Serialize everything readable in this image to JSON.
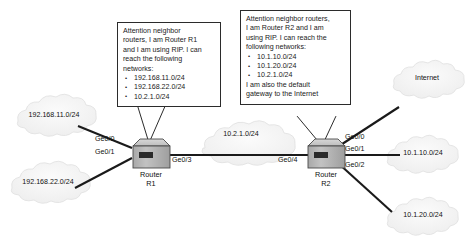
{
  "diagram": {
    "background_color": "#ffffff",
    "line_color": "#1a1a1a",
    "router_body_color": "#b8b8b8",
    "cloud_color": "#f2f2f2"
  },
  "callouts": [
    {
      "id": "r1-advertisement",
      "intro": [
        "Attention neighbor",
        "routers, I am Router R1",
        "and I am using RIP. I can",
        "reach the following",
        "networks:"
      ],
      "networks": [
        "192.168.11.0/24",
        "192.168.22.0/24",
        "10.2.1.0/24"
      ],
      "outro": []
    },
    {
      "id": "r2-advertisement",
      "intro": [
        "Attention neighbor routers,",
        "I am Router R2 and I am",
        "using RIP. I can reach the",
        "following networks:"
      ],
      "networks": [
        "10.1.10.0/24",
        "10.1.20.0/24",
        "10.2.1.0/24"
      ],
      "outro": [
        "I am also the default",
        "gateway to the Internet"
      ]
    }
  ],
  "routers": [
    {
      "id": "r1",
      "name": "Router",
      "id_label": "R1"
    },
    {
      "id": "r2",
      "name": "Router",
      "id_label": "R2"
    }
  ],
  "clouds": [
    {
      "id": "net-192-168-11",
      "label": "192.168.11.0/24"
    },
    {
      "id": "net-192-168-22",
      "label": "192.168.22.0/24"
    },
    {
      "id": "net-internet",
      "label": "Internet"
    },
    {
      "id": "net-10-1-10",
      "label": "10.1.10.0/24"
    },
    {
      "id": "net-10-1-20",
      "label": "10.1.20.0/24"
    },
    {
      "id": "net-10-2-1",
      "label": "10.2.1.0/24"
    }
  ],
  "interfaces": [
    {
      "id": "r1-ge00",
      "label": "Ge0/0"
    },
    {
      "id": "r1-ge01",
      "label": "Ge0/1"
    },
    {
      "id": "r1-ge03",
      "label": "Ge0/3"
    },
    {
      "id": "r2-ge04",
      "label": "Ge0/4"
    },
    {
      "id": "r2-ge00",
      "label": "Ge0/0"
    },
    {
      "id": "r2-ge01",
      "label": "Ge0/1"
    },
    {
      "id": "r2-ge02",
      "label": "Ge0/2"
    }
  ]
}
